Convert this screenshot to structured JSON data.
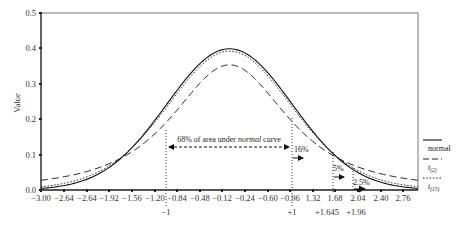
{
  "chart_data": {
    "type": "line",
    "title": "",
    "xlabel": "",
    "ylabel": "Value",
    "xlim": [
      -3.0,
      3.0
    ],
    "ylim": [
      0.0,
      0.5
    ],
    "grid": false,
    "legend_position": "right",
    "x_tick_labels": [
      "−3.00",
      "−2.64",
      "−2.64",
      "−1.92",
      "−1.56",
      "−1.20",
      "−0.84",
      "−0.48",
      "−0.12",
      "−0.24",
      "−0.60",
      "−0.96",
      "1.32",
      "1.68",
      "2.04",
      "2.40",
      "2.76"
    ],
    "y_tick_labels": [
      "0.0",
      "0.1",
      "0.2",
      "0.3",
      "0.4",
      "0.5"
    ],
    "series": [
      {
        "name": "normal",
        "style": "solid",
        "df": null,
        "peak": 0.399
      },
      {
        "name": "t(2)",
        "style": "dashed",
        "df": 2,
        "peak": 0.354
      },
      {
        "name": "t(15)",
        "style": "dotted",
        "df": 15,
        "peak": 0.392
      }
    ],
    "x": [
      -3.0,
      -2.5,
      -2.0,
      -1.5,
      -1.0,
      -0.5,
      0.0,
      0.5,
      1.0,
      1.5,
      2.0,
      2.5,
      3.0
    ],
    "series_values": {
      "normal": [
        0.004,
        0.018,
        0.054,
        0.13,
        0.242,
        0.352,
        0.399,
        0.352,
        0.242,
        0.13,
        0.054,
        0.018,
        0.004
      ],
      "t(2)": [
        0.027,
        0.042,
        0.068,
        0.114,
        0.192,
        0.298,
        0.354,
        0.298,
        0.192,
        0.114,
        0.068,
        0.042,
        0.027
      ],
      "t(15)": [
        0.008,
        0.023,
        0.058,
        0.131,
        0.237,
        0.343,
        0.392,
        0.343,
        0.237,
        0.131,
        0.058,
        0.023,
        0.008
      ]
    },
    "vertical_markers": [
      {
        "x": -1,
        "label": "−1"
      },
      {
        "x": 1,
        "label": "+1"
      },
      {
        "x": 1.645,
        "label": "+1.645"
      },
      {
        "x": 1.96,
        "label": "+1.96"
      }
    ],
    "annotations": [
      {
        "text_pre": "68% of area under ",
        "text_em": "normal",
        "text_post": " curve"
      },
      {
        "text": "16%"
      },
      {
        "text": "5%"
      },
      {
        "text": "2.5%"
      }
    ]
  },
  "legend": {
    "normal": "normal",
    "t2_base": "t",
    "t2_sub": "(2)",
    "t15_base": "t",
    "t15_sub": "(15)"
  },
  "labels": {
    "ylabel": "Value",
    "ann68_pre": "68% of area under ",
    "ann68_em": "normal",
    "ann68_post": " curve",
    "ann16": "16%",
    "ann5": "5%",
    "ann25": "2.5%",
    "m_neg1": "−1",
    "m_pos1": "+1",
    "m_1645": "+1.645",
    "m_196": "+1.96",
    "xt0": "−3.00",
    "xt1": "−2.64",
    "xt2": "−2.64",
    "xt3": "−1.92",
    "xt4": "−1.56",
    "xt5": "−1.20",
    "xt6": "−0.84",
    "xt7": "−0.48",
    "xt8": "−0.12",
    "xt9": "−0.24",
    "xt10": "−0.60",
    "xt11": "−0.96",
    "xt12": "1.32",
    "xt13": "1.68",
    "xt14": "2.04",
    "xt15": "2.40",
    "xt16": "2.76",
    "yt0": "0.0",
    "yt1": "0.1",
    "yt2": "0.2",
    "yt3": "0.3",
    "yt4": "0.4",
    "yt5": "0.5"
  }
}
